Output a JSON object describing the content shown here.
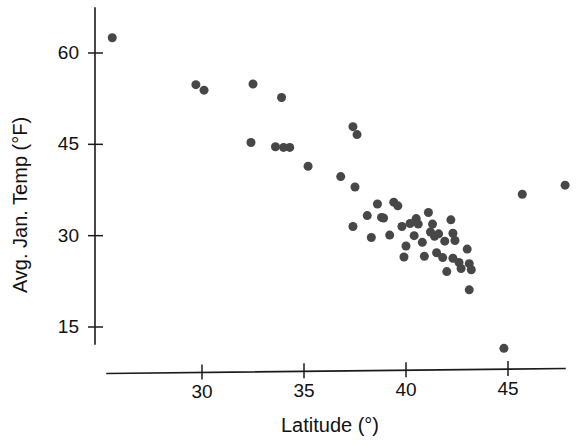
{
  "chart_data": {
    "type": "scatter",
    "title": "",
    "xlabel": "Latitude (°)",
    "ylabel": "Avg. Jan. Temp (°F)",
    "xlim": [
      25,
      48.5
    ],
    "ylim": [
      10,
      64
    ],
    "xticks": [
      30,
      35,
      40,
      45
    ],
    "xticklabels": [
      "30",
      "35",
      "40",
      "45"
    ],
    "yticks": [
      15,
      30,
      45,
      60
    ],
    "yticklabels": [
      "15",
      "30",
      "45",
      "60"
    ],
    "grid": false,
    "legend": null,
    "marker": {
      "shape": "circle",
      "color": "#474747",
      "size_px": 9
    },
    "series": [
      {
        "name": "US cities",
        "points": [
          [
            25.6,
            62.5
          ],
          [
            29.7,
            54.8
          ],
          [
            30.1,
            53.9
          ],
          [
            32.5,
            54.9
          ],
          [
            33.9,
            52.7
          ],
          [
            32.4,
            45.3
          ],
          [
            33.6,
            44.6
          ],
          [
            34.0,
            44.5
          ],
          [
            34.3,
            44.5
          ],
          [
            37.4,
            47.9
          ],
          [
            37.6,
            46.6
          ],
          [
            35.2,
            41.4
          ],
          [
            36.8,
            39.7
          ],
          [
            37.5,
            38.0
          ],
          [
            37.4,
            31.5
          ],
          [
            38.6,
            35.2
          ],
          [
            38.1,
            33.3
          ],
          [
            38.8,
            33.0
          ],
          [
            38.9,
            32.9
          ],
          [
            39.4,
            35.5
          ],
          [
            39.6,
            34.9
          ],
          [
            39.2,
            30.1
          ],
          [
            38.3,
            29.7
          ],
          [
            39.8,
            31.5
          ],
          [
            40.2,
            32.0
          ],
          [
            40.5,
            32.8
          ],
          [
            40.6,
            31.9
          ],
          [
            40.4,
            30.0
          ],
          [
            40.0,
            28.3
          ],
          [
            40.8,
            28.9
          ],
          [
            41.1,
            33.8
          ],
          [
            41.3,
            31.9
          ],
          [
            41.2,
            30.6
          ],
          [
            41.4,
            29.9
          ],
          [
            41.6,
            30.3
          ],
          [
            41.5,
            27.2
          ],
          [
            41.8,
            26.4
          ],
          [
            42.2,
            32.6
          ],
          [
            42.3,
            30.4
          ],
          [
            42.4,
            29.2
          ],
          [
            42.3,
            26.3
          ],
          [
            42.6,
            25.6
          ],
          [
            42.7,
            24.6
          ],
          [
            43.0,
            27.8
          ],
          [
            43.1,
            25.4
          ],
          [
            43.2,
            24.4
          ],
          [
            43.1,
            21.1
          ],
          [
            42.0,
            24.1
          ],
          [
            40.9,
            26.6
          ],
          [
            39.9,
            26.5
          ],
          [
            41.9,
            29.1
          ],
          [
            44.8,
            11.5
          ],
          [
            45.7,
            36.8
          ],
          [
            47.8,
            38.3
          ]
        ]
      }
    ]
  },
  "axes": {
    "x_axis_name": "latitude-axis",
    "y_axis_name": "temperature-axis"
  }
}
